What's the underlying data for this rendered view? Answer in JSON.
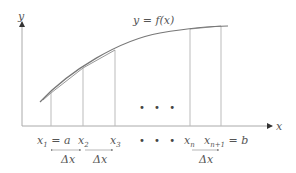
{
  "diagram": {
    "type": "riemann-partition",
    "curve_label": "y = f(x)",
    "axis_labels": {
      "x": "x",
      "y": "y"
    },
    "points": [
      {
        "name": "x",
        "sub": "1",
        "suffix": " = a"
      },
      {
        "name": "x",
        "sub": "2",
        "suffix": ""
      },
      {
        "name": "x",
        "sub": "3",
        "suffix": ""
      },
      {
        "name": "x",
        "sub": "n",
        "suffix": ""
      },
      {
        "name": "x",
        "sub": "n+1",
        "suffix": " = b"
      }
    ],
    "ellipsis": "• • •",
    "delta_label": "Δx",
    "colors": {
      "lines": "#9a9a9a",
      "curve": "#777777",
      "text": "#555555"
    }
  }
}
